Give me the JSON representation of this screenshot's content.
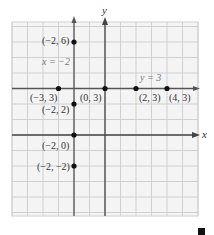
{
  "figure": {
    "grid": {
      "x_min": -6,
      "x_max": 6,
      "y_min": -5,
      "y_max": 7,
      "origin_px": [
        105,
        135
      ],
      "cell_px": 15.5,
      "grid_color": "#d0d0d0",
      "axis_color": "#444444",
      "line_color": "#555555"
    },
    "axes": {
      "x_label": "x",
      "y_label": "y"
    },
    "lines": [
      {
        "label": "x = −2",
        "orientation": "vertical",
        "value": -2
      },
      {
        "label": "y = 3",
        "orientation": "horizontal",
        "value": 3
      }
    ],
    "points": [
      {
        "label": "(−2, 6)",
        "x": -2,
        "y": 6
      },
      {
        "label": "(−2, 2)",
        "x": -2,
        "y": 2
      },
      {
        "label": "(−2, 0)",
        "x": -2,
        "y": 0
      },
      {
        "label": "(−2, −2)",
        "x": -2,
        "y": -2
      },
      {
        "label": "(−3, 3)",
        "x": -3,
        "y": 3
      },
      {
        "label": "(0, 3)",
        "x": 0,
        "y": 3
      },
      {
        "label": "(2, 3)",
        "x": 2,
        "y": 3
      },
      {
        "label": "(4, 3)",
        "x": 4,
        "y": 3
      }
    ],
    "end_mark": "end-of-proof-square"
  }
}
